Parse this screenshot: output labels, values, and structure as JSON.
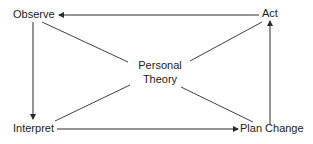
{
  "diagram": {
    "type": "cycle-with-hub",
    "nodes": [
      {
        "id": "observe",
        "label": "Observe"
      },
      {
        "id": "act",
        "label": "Act"
      },
      {
        "id": "interpret",
        "label": "Interpret"
      },
      {
        "id": "plan_change",
        "label": "Plan Change"
      }
    ],
    "center": {
      "id": "personal_theory",
      "line1": "Personal",
      "line2": "Theory"
    },
    "edges": [
      {
        "from": "act",
        "to": "observe",
        "arrow": true
      },
      {
        "from": "observe",
        "to": "interpret",
        "arrow": true
      },
      {
        "from": "interpret",
        "to": "plan_change",
        "arrow": true
      },
      {
        "from": "plan_change",
        "to": "act",
        "arrow": true
      },
      {
        "from": "personal_theory",
        "to": "observe",
        "arrow": false
      },
      {
        "from": "personal_theory",
        "to": "act",
        "arrow": false
      },
      {
        "from": "personal_theory",
        "to": "interpret",
        "arrow": false
      },
      {
        "from": "personal_theory",
        "to": "plan_change",
        "arrow": false
      }
    ],
    "colors": {
      "line": "#2a2a2a",
      "text": "#1a1a1a",
      "background": "#ffffff"
    }
  }
}
